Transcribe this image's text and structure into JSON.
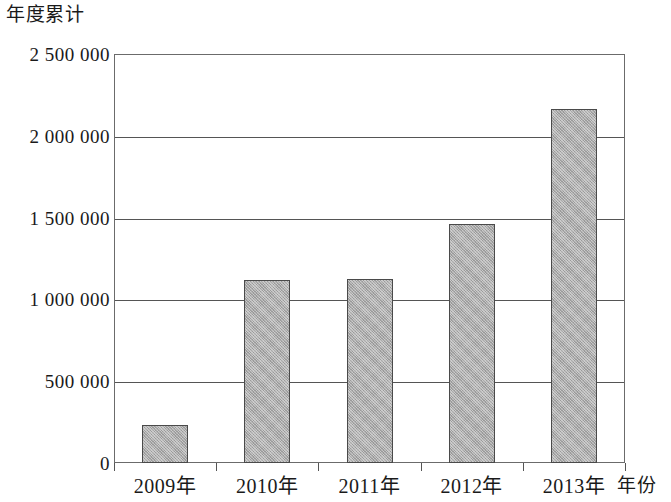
{
  "chart_data": {
    "type": "bar",
    "title": "",
    "ylabel": "年度累计",
    "xlabel": "年份",
    "categories": [
      "2009年",
      "2010年",
      "2011年",
      "2012年",
      "2013年"
    ],
    "values": [
      230000,
      1120000,
      1125000,
      1460000,
      2165000
    ],
    "series": [
      {
        "name": "年度累计",
        "values": [
          230000,
          1120000,
          1125000,
          1460000,
          2165000
        ]
      }
    ],
    "ylim": [
      0,
      2500000
    ],
    "ytick_values": [
      0,
      500000,
      1000000,
      1500000,
      2000000,
      2500000
    ],
    "ytick_labels": [
      "0",
      "500 000",
      "1 000 000",
      "1 500 000",
      "2 000 000",
      "2 500 000"
    ],
    "grid": true,
    "grid_axis": "y",
    "legend": false,
    "legend_position": "none",
    "bar_fill_color": "#ababab",
    "bar_edge_color": "#4a4a4a",
    "axis_color": "#555555",
    "background_color": "#ffffff"
  }
}
